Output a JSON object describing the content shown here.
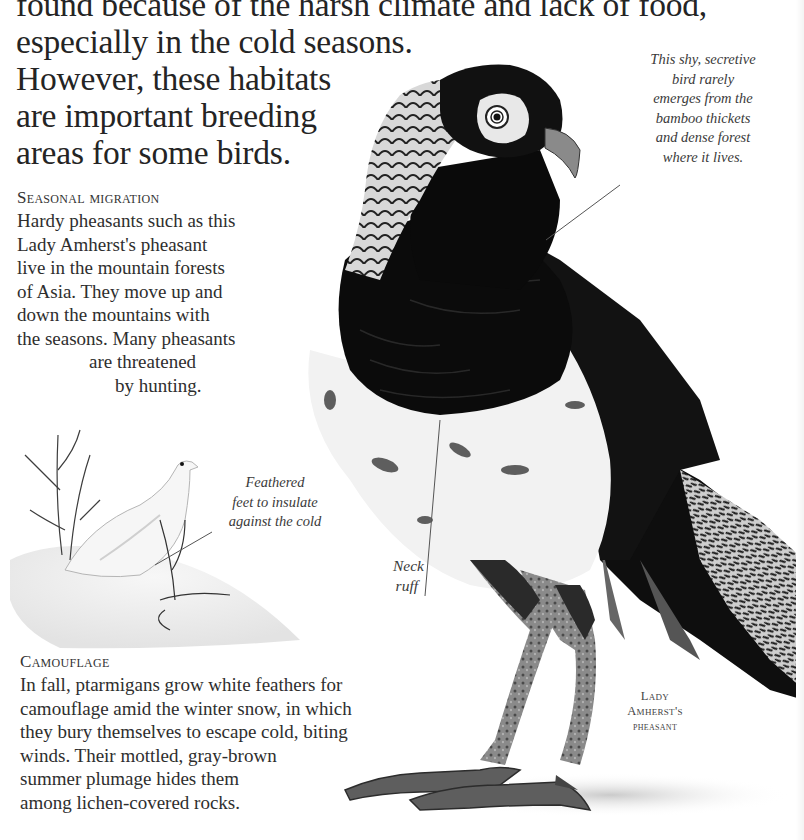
{
  "intro": {
    "lines": [
      "found because of the harsh climate and lack of food,",
      "especially in the cold seasons.",
      "However, these habitats",
      "are important breeding",
      "areas for some birds."
    ]
  },
  "seasonal_migration": {
    "heading": "Seasonal migration",
    "lines": [
      "Hardy pheasants such as this",
      "Lady Amherst's pheasant",
      "live in the mountain forests",
      "of Asia. They move up and",
      "down the mountains with",
      "the seasons. Many pheasants",
      "are threatened",
      "by hunting."
    ]
  },
  "ptarmigan_caption": {
    "lines": [
      "Feathered",
      "feet to insulate",
      "against the cold"
    ]
  },
  "pheasant_caption": {
    "lines": [
      "This shy, secretive",
      "bird rarely",
      "emerges from the",
      "bamboo thickets",
      "and dense forest",
      "where it lives."
    ]
  },
  "neck_ruff_label": {
    "lines": [
      "Neck",
      "ruff"
    ]
  },
  "pheasant_name_label": {
    "lines": [
      "Lady",
      "Amherst's",
      "pheasant"
    ]
  },
  "camouflage": {
    "heading": "Camouflage",
    "lines": [
      "In fall, ptarmigans grow white feathers for",
      "camouflage amid the winter snow, in which",
      "they bury themselves to escape cold, biting",
      "winds. Their mottled, gray-brown",
      "summer plumage hides them",
      "among lichen-covered rocks."
    ]
  },
  "illustrations": {
    "pheasant": "lady-amherst-pheasant-photo",
    "ptarmigan": "white-ptarmigan-drawing"
  },
  "colors": {
    "page_bg": "#ffffff",
    "text": "#2b2b2b",
    "pheasant_dark": "#111111",
    "pheasant_white": "#f2f2f2",
    "leader_line": "#555555"
  }
}
